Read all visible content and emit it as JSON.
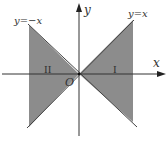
{
  "diagram": {
    "type": "coordinate-region-sketch",
    "axes": {
      "x_label": "x",
      "y_label": "y",
      "origin_label": "O"
    },
    "lines": [
      {
        "label": "y=−x",
        "equation": "y = -x"
      },
      {
        "label": "y=x",
        "equation": "y = x"
      }
    ],
    "regions": [
      {
        "label": "I",
        "description": "shaded wedge between y=x and y=−x, right of origin"
      },
      {
        "label": "II",
        "description": "shaded wedge between y=x and y=−x, left of origin"
      }
    ],
    "colors": {
      "shade": "#8c8c8c",
      "line": "#333333",
      "background": "#ffffff"
    }
  }
}
